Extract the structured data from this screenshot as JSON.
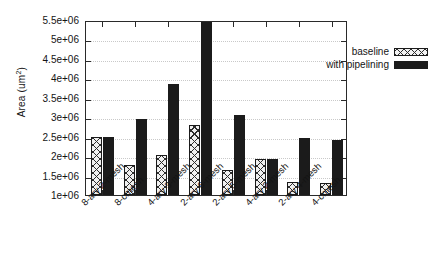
{
  "chart_data": {
    "type": "bar",
    "title": "",
    "xlabel": "",
    "ylabel": "Area (um2)",
    "ylabel_base": "Area (um",
    "ylabel_sup": "2",
    "ylabel_close": ")",
    "ylim": [
      1000000,
      5500000
    ],
    "ytick_labels": [
      "5.5e+06",
      "5e+06",
      "4.5e+06",
      "4e+06",
      "3.5e+06",
      "3e+06",
      "2.5e+06",
      "2e+06",
      "1.5e+06",
      "1e+06"
    ],
    "ytick_values": [
      5500000,
      5000000,
      4500000,
      4000000,
      3500000,
      3000000,
      2500000,
      2000000,
      1500000,
      1000000
    ],
    "grid": true,
    "legend_position": "top-right",
    "categories": [
      "8-ary 2-mesh",
      "8-cmesh",
      "4-ary 3-mesh",
      "2-ary 6-mesh",
      "2-ary 5-mesh",
      "4-ary 2-mesh",
      "2-ary 4-mesh",
      "4-cmesh"
    ],
    "series": [
      {
        "name": "baseline",
        "color": "#f0f0f0",
        "pattern": "crosshatch",
        "values": [
          2480000,
          1760000,
          2040000,
          2800000,
          1650000,
          1920000,
          1330000,
          1320000
        ]
      },
      {
        "name": "with pipelining",
        "color": "#1b1b1b",
        "pattern": "solid",
        "values": [
          2480000,
          2950000,
          3860000,
          5450000,
          3070000,
          1920000,
          2470000,
          2420000
        ]
      }
    ]
  },
  "legend": {
    "entries": [
      {
        "label": "baseline",
        "style": "baseline"
      },
      {
        "label": "with pipelining",
        "style": "pipelined"
      }
    ]
  }
}
